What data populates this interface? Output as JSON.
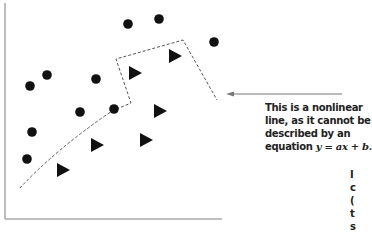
{
  "chart_data": {
    "type": "scatter",
    "title": "",
    "xlabel": "",
    "ylabel": "",
    "grid": false,
    "axes": {
      "x_axis_visible": true,
      "y_axis_visible": true,
      "ticks": false
    },
    "series": [
      {
        "name": "circles",
        "marker": "circle",
        "color": "#111111",
        "points": [
          [
            128,
            24
          ],
          [
            159,
            19
          ],
          [
            214,
            42
          ],
          [
            47,
            75
          ],
          [
            30,
            86
          ],
          [
            96,
            79
          ],
          [
            80,
            112
          ],
          [
            114,
            109
          ],
          [
            32,
            132
          ],
          [
            27,
            159
          ]
        ]
      },
      {
        "name": "triangles",
        "marker": "triangle-right",
        "color": "#111111",
        "points": [
          [
            135,
            73
          ],
          [
            175,
            56
          ],
          [
            160,
            111
          ],
          [
            146,
            140
          ],
          [
            97,
            145
          ],
          [
            63,
            170
          ]
        ]
      }
    ],
    "decision_boundary": {
      "style": "dashed",
      "description": "nonlinear boundary separating circles and triangles"
    },
    "annotation": {
      "line1": "This is a nonlinear",
      "line2": "line, as it cannot be",
      "line3": "described by an",
      "line4_prefix": "equation ",
      "line4_equation": "y = ax + b."
    }
  },
  "annotation": {
    "line1": "This is a nonlinear",
    "line2": "line, as it cannot be",
    "line3": "described by an",
    "line4_prefix": "equation ",
    "line4_equation": "y = ax + b."
  },
  "cutoff_text": [
    "I",
    "c",
    "(",
    "t",
    "s"
  ],
  "colors": {
    "marker": "#111111",
    "axis": "#999999",
    "dash": "#555555",
    "arrow": "#777777",
    "text": "#222222"
  }
}
